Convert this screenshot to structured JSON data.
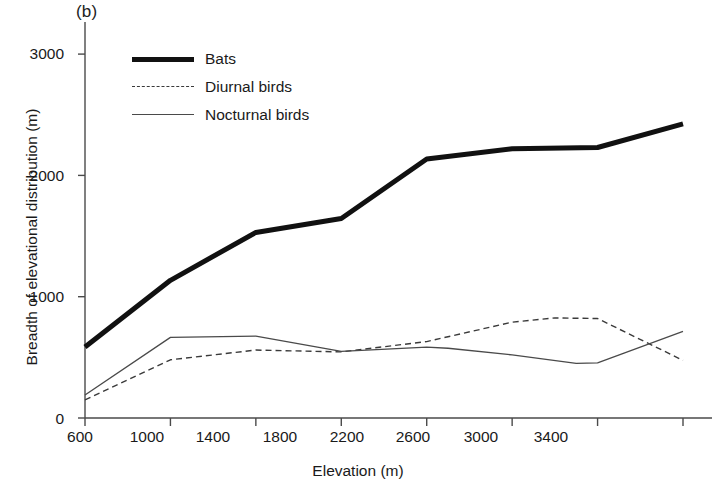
{
  "figure": {
    "panel_label": "(b)",
    "background_color": "#ffffff"
  },
  "axes": {
    "x_title": "Elevation (m)",
    "y_title": "Breadth of elevational distribution (m)",
    "x_tick_labels": [
      "600",
      "1000",
      "1400",
      "1800",
      "2200",
      "2600",
      "3000",
      "3400"
    ],
    "y_tick_labels": [
      "0",
      "1000",
      "2000",
      "3000"
    ]
  },
  "legend": {
    "items": [
      {
        "label": "Bats",
        "icon": "thick-solid-line-icon",
        "color": "#111111"
      },
      {
        "label": "Diurnal birds",
        "icon": "dashed-line-icon",
        "color": "#3a3a3a"
      },
      {
        "label": "Nocturnal birds",
        "icon": "thin-solid-line-icon",
        "color": "#4a4a4a"
      }
    ]
  },
  "chart_data": {
    "type": "line",
    "title": "",
    "panel": "(b)",
    "xlabel": "Elevation (m)",
    "ylabel": "Breadth of elevational distribution (m)",
    "x": [
      600,
      1000,
      1400,
      1800,
      2200,
      2600,
      3000,
      3400
    ],
    "xlim": [
      600,
      3400
    ],
    "ylim": [
      0,
      3200
    ],
    "yticks": [
      0,
      1000,
      2000,
      3000
    ],
    "xticks": [
      600,
      1000,
      1400,
      1800,
      2200,
      2600,
      3000,
      3400
    ],
    "grid": false,
    "legend_position": "upper-left-inside",
    "series": [
      {
        "name": "Bats",
        "style": "solid",
        "linewidth": 5,
        "color": "#111111",
        "values": [
          585,
          1135,
          1530,
          1645,
          2135,
          2220,
          2230,
          2425
        ]
      },
      {
        "name": "Diurnal birds",
        "style": "dashed",
        "linewidth": 1.4,
        "color": "#3a3a3a",
        "values": [
          150,
          480,
          560,
          545,
          630,
          790,
          820,
          475
        ]
      },
      {
        "name": "Nocturnal birds",
        "style": "solid",
        "linewidth": 1.3,
        "color": "#4a4a4a",
        "values": [
          190,
          665,
          675,
          550,
          585,
          520,
          455,
          715
        ]
      }
    ],
    "extra_vertices": {
      "Diurnal birds": [
        [
          2800,
          825
        ],
        [
          3000,
          820
        ]
      ],
      "Nocturnal birds": [
        [
          2300,
          575
        ],
        [
          2900,
          450
        ],
        [
          3000,
          455
        ]
      ]
    }
  }
}
